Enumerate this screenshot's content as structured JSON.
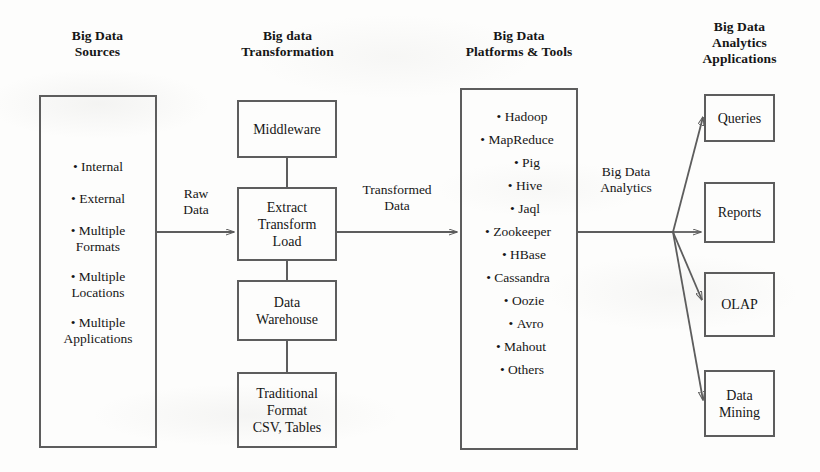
{
  "diagram": {
    "line_color": "#5d5d5d",
    "text_color": "#161616",
    "background": "#fdfdfc"
  },
  "columns": [
    {
      "id": "sources",
      "heading": "Big Data\nSources"
    },
    {
      "id": "transformation",
      "heading": "Big data\nTransformation"
    },
    {
      "id": "platforms",
      "heading": "Big Data\nPlatforms & Tools"
    },
    {
      "id": "applications",
      "heading": "Big Data\nAnalytics\nApplications"
    }
  ],
  "sources": {
    "items": [
      "Internal",
      "External",
      "Multiple\nFormats",
      "Multiple\nLocations",
      "Multiple\nApplications"
    ]
  },
  "transformation": {
    "boxes": [
      {
        "id": "middleware",
        "label": "Middleware"
      },
      {
        "id": "etl",
        "label": "Extract\nTransform\nLoad"
      },
      {
        "id": "data-warehouse",
        "label": "Data\nWarehouse"
      },
      {
        "id": "traditional-format",
        "label": "Traditional\nFormat\nCSV, Tables"
      }
    ]
  },
  "platforms": {
    "items": [
      "Hadoop",
      "MapReduce",
      "Pig",
      "Hive",
      "Jaql",
      "Zookeeper",
      "HBase",
      "Cassandra",
      "Oozie",
      "Avro",
      "Mahout",
      "Others"
    ]
  },
  "applications": {
    "boxes": [
      {
        "id": "queries",
        "label": "Queries"
      },
      {
        "id": "reports",
        "label": "Reports"
      },
      {
        "id": "olap",
        "label": "OLAP"
      },
      {
        "id": "data-mining",
        "label": "Data\nMining"
      }
    ]
  },
  "edges": [
    {
      "id": "raw-data",
      "label": "Raw\nData"
    },
    {
      "id": "transformed-data",
      "label": "Transformed\nData"
    },
    {
      "id": "big-data-analytics",
      "label": "Big Data\nAnalytics"
    }
  ]
}
